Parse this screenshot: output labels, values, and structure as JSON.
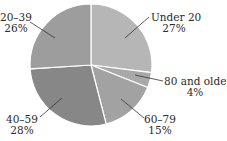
{
  "chart_data": {
    "type": "pie",
    "title": "",
    "start_angle_deg": 90,
    "direction": "clockwise",
    "categories": [
      "Under 20",
      "80 and older",
      "60–79",
      "40–59",
      "20–39"
    ],
    "values": [
      27,
      4,
      15,
      28,
      26
    ],
    "value_labels": [
      "27%",
      "4%",
      "15%",
      "28%",
      "26%"
    ],
    "colors": [
      "#b6b6b6",
      "#a9a9a9",
      "#a2a2a2",
      "#878787",
      "#9d9d9d"
    ],
    "legend": "none (direct labels with leader lines)",
    "grid": false
  },
  "labels": {
    "under20": {
      "name": "Under 20",
      "pct": "27%"
    },
    "over80": {
      "name": "80 and older",
      "pct": "4%"
    },
    "age60_79": {
      "name": "60–79",
      "pct": "15%"
    },
    "age40_59": {
      "name": "40–59",
      "pct": "28%"
    },
    "age20_39": {
      "name": "20–39",
      "pct": "26%"
    }
  }
}
